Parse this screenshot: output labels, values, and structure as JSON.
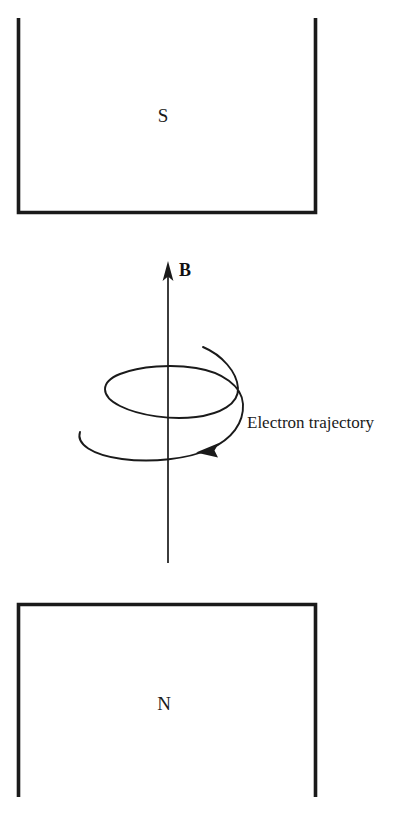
{
  "figure": {
    "kind": "physics-diagram",
    "background_color": "#ffffff",
    "ink_color": "#1a1a1a"
  },
  "poles": {
    "top": {
      "label": "S",
      "name": "south-pole",
      "shape": "rectangle-open-top",
      "x": 17,
      "y": 18,
      "width": 300,
      "height": 196,
      "label_x": 163,
      "label_y": 122
    },
    "bottom": {
      "label": "N",
      "name": "north-pole",
      "shape": "rectangle-open-bottom",
      "x": 17,
      "y": 603,
      "width": 300,
      "height": 194,
      "label_x": 164,
      "label_y": 710
    }
  },
  "field": {
    "label": "B",
    "label_x": 179,
    "label_y": 276,
    "axis_x": 168,
    "axis_top_y": 262,
    "axis_bottom_y": 563,
    "direction": "up",
    "arrow_tip_y": 261
  },
  "trajectory": {
    "label": "Electron trajectory",
    "label_x": 247,
    "label_y": 428,
    "turns": 2,
    "rotation_sense": "clockwise-viewed-from-above",
    "center_x": 168,
    "upper_loop": {
      "cx": 168,
      "cy": 388,
      "rx": 63,
      "ry": 22
    },
    "lower_loop": {
      "cx": 168,
      "cy": 437,
      "rx": 88,
      "ry": 26
    },
    "start_x": 203,
    "start_y": 347,
    "end_x": 80,
    "end_y": 432,
    "arrow_x": 201,
    "arrow_y": 451
  }
}
